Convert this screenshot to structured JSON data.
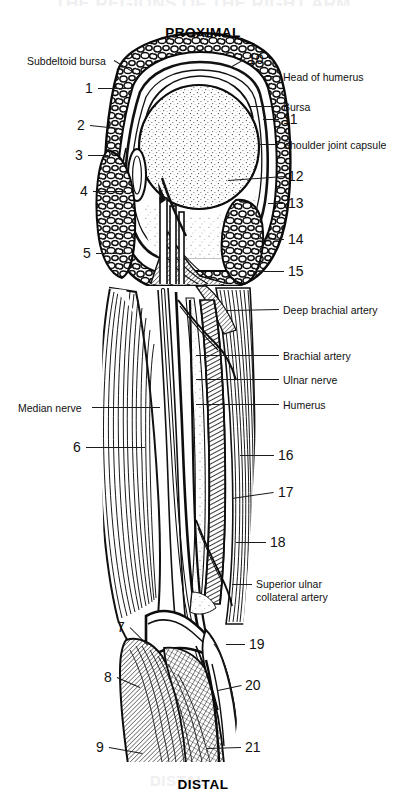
{
  "page": {
    "title_ghost": "THE REGIONS OF THE RIGHT ARM",
    "distal_ghost": "DISTAL",
    "background": "#ffffff",
    "ink": "#111111"
  },
  "orientation": {
    "proximal": "PROXIMAL",
    "distal": "DISTAL"
  },
  "labels_left": [
    {
      "id": "subdeltoid-bursa",
      "text": "Subdeltoid bursa",
      "x": 27,
      "y": 55,
      "lead": {
        "x1": 114,
        "y1": 60,
        "x2": 134,
        "y2": 72
      }
    },
    {
      "id": "median-nerve",
      "text": "Median nerve",
      "x": 18,
      "y": 402,
      "lead": {
        "x1": 92,
        "y1": 407,
        "x2": 160,
        "y2": 407
      }
    }
  ],
  "labels_right": [
    {
      "id": "head-of-humerus",
      "text": "Head of humerus",
      "x": 283,
      "y": 71,
      "lead": {
        "x1": 262,
        "y1": 76,
        "x2": 279,
        "y2": 76
      }
    },
    {
      "id": "bursa",
      "text": "Bursa",
      "x": 283,
      "y": 101,
      "lead": {
        "x1": 250,
        "y1": 106,
        "x2": 279,
        "y2": 106
      }
    },
    {
      "id": "shoulder-joint-capsule",
      "text": "Shoulder joint capsule",
      "x": 283,
      "y": 139,
      "lead": {
        "x1": 258,
        "y1": 144,
        "x2": 279,
        "y2": 144
      }
    },
    {
      "id": "deep-brachial-artery",
      "text": "Deep brachial artery",
      "x": 283,
      "y": 304,
      "lead": {
        "x1": 226,
        "y1": 310,
        "x2": 279,
        "y2": 309
      }
    },
    {
      "id": "brachial-artery",
      "text": "Brachial artery",
      "x": 283,
      "y": 350,
      "lead": {
        "x1": 196,
        "y1": 355,
        "x2": 279,
        "y2": 355
      }
    },
    {
      "id": "ulnar-nerve",
      "text": "Ulnar nerve",
      "x": 283,
      "y": 374,
      "lead": {
        "x1": 196,
        "y1": 379,
        "x2": 279,
        "y2": 379
      }
    },
    {
      "id": "humerus",
      "text": "Humerus",
      "x": 283,
      "y": 399,
      "lead": {
        "x1": 196,
        "y1": 404,
        "x2": 279,
        "y2": 404
      }
    }
  ],
  "labels_right_multiline": [
    {
      "id": "superior-ulnar-collateral-artery",
      "line1": "Superior ulnar",
      "line2": "collateral artery",
      "x": 256,
      "y": 578,
      "lead": {
        "x1": 232,
        "y1": 584,
        "x2": 252,
        "y2": 584
      }
    }
  ],
  "numbers_left": [
    {
      "n": "1",
      "x": 85,
      "y": 81,
      "lead": {
        "x1": 98,
        "y1": 88,
        "x2": 132,
        "y2": 88
      }
    },
    {
      "n": "2",
      "x": 77,
      "y": 118,
      "lead": {
        "x1": 90,
        "y1": 125,
        "x2": 118,
        "y2": 128
      }
    },
    {
      "n": "3",
      "x": 75,
      "y": 148,
      "lead": {
        "x1": 88,
        "y1": 155,
        "x2": 108,
        "y2": 155
      }
    },
    {
      "n": "4",
      "x": 80,
      "y": 184,
      "lead": {
        "x1": 93,
        "y1": 191,
        "x2": 126,
        "y2": 191
      }
    },
    {
      "n": "5",
      "x": 83,
      "y": 246,
      "lead": {
        "x1": 96,
        "y1": 253,
        "x2": 130,
        "y2": 253
      }
    },
    {
      "n": "6",
      "x": 73,
      "y": 440,
      "lead": {
        "x1": 86,
        "y1": 447,
        "x2": 145,
        "y2": 447
      }
    },
    {
      "n": "7",
      "x": 117,
      "y": 620,
      "lead": {
        "x1": 130,
        "y1": 627,
        "x2": 148,
        "y2": 645
      }
    },
    {
      "n": "8",
      "x": 104,
      "y": 670,
      "lead": {
        "x1": 117,
        "y1": 677,
        "x2": 140,
        "y2": 687
      }
    },
    {
      "n": "9",
      "x": 96,
      "y": 740,
      "lead": {
        "x1": 109,
        "y1": 747,
        "x2": 142,
        "y2": 753
      }
    }
  ],
  "numbers_right": [
    {
      "n": "10",
      "x": 248,
      "y": 52,
      "lead": {
        "x1": 232,
        "y1": 66,
        "x2": 246,
        "y2": 58
      }
    },
    {
      "n": "11",
      "x": 283,
      "y": 112,
      "lead": {
        "x1": 263,
        "y1": 119,
        "x2": 279,
        "y2": 119
      }
    },
    {
      "n": "12",
      "x": 288,
      "y": 169,
      "lead": {
        "x1": 228,
        "y1": 180,
        "x2": 284,
        "y2": 176
      }
    },
    {
      "n": "13",
      "x": 288,
      "y": 196,
      "lead": {
        "x1": 268,
        "y1": 203,
        "x2": 284,
        "y2": 203
      }
    },
    {
      "n": "14",
      "x": 288,
      "y": 232,
      "lead": {
        "x1": 252,
        "y1": 238,
        "x2": 284,
        "y2": 239
      }
    },
    {
      "n": "15",
      "x": 288,
      "y": 264,
      "lead": {
        "x1": 250,
        "y1": 271,
        "x2": 284,
        "y2": 271
      }
    },
    {
      "n": "16",
      "x": 278,
      "y": 448,
      "lead": {
        "x1": 240,
        "y1": 455,
        "x2": 274,
        "y2": 455
      }
    },
    {
      "n": "17",
      "x": 278,
      "y": 485,
      "lead": {
        "x1": 232,
        "y1": 498,
        "x2": 274,
        "y2": 492
      }
    },
    {
      "n": "18",
      "x": 270,
      "y": 535,
      "lead": {
        "x1": 236,
        "y1": 542,
        "x2": 266,
        "y2": 542
      }
    },
    {
      "n": "19",
      "x": 249,
      "y": 637,
      "lead": {
        "x1": 226,
        "y1": 644,
        "x2": 245,
        "y2": 644
      }
    },
    {
      "n": "20",
      "x": 245,
      "y": 678,
      "lead": {
        "x1": 218,
        "y1": 690,
        "x2": 241,
        "y2": 685
      }
    },
    {
      "n": "21",
      "x": 245,
      "y": 740,
      "lead": {
        "x1": 207,
        "y1": 748,
        "x2": 241,
        "y2": 747
      }
    }
  ],
  "figure": {
    "caption": "cross-section of right shoulder with upper arm musculature",
    "regions": [
      "deltoid-cross-section",
      "humeral-head-stipple",
      "joint-capsule",
      "biceps-brachii",
      "triceps-brachii",
      "humerus-shaft",
      "neurovascular-bundle",
      "elbow-tendons"
    ]
  }
}
